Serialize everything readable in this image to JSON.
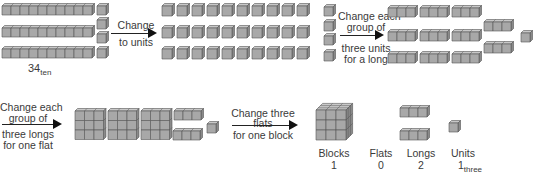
{
  "diagram": {
    "colors": {
      "face": "#a8a8a8",
      "top": "#c8c8c8",
      "side": "#8a8a8a",
      "edge": "#555555",
      "arrow": "#111111"
    },
    "steps": [
      {
        "id": "start",
        "label_main": "34",
        "label_sub": "ten",
        "contents": {
          "longs_of_ten": 3,
          "units": 4
        }
      },
      {
        "id": "step1",
        "arrow_line1": "Change",
        "arrow_line2": "to units",
        "contents": {
          "units": 34,
          "layout": "3 rows of 11 + 1"
        }
      },
      {
        "id": "step2",
        "arrow_line1": "Change each",
        "arrow_line2": "group of",
        "arrow_line3": "three units",
        "arrow_line4": "for a long",
        "contents": {
          "longs_of_three": 11,
          "units": 1
        }
      },
      {
        "id": "step3",
        "arrow_line1": "Change each",
        "arrow_line2": "group of",
        "arrow_line3": "three longs",
        "arrow_line4": "for one flat",
        "contents": {
          "flats": 3,
          "longs": 2,
          "units": 1
        }
      },
      {
        "id": "step4",
        "arrow_line1": "Change three",
        "arrow_line2": "flats",
        "arrow_line3": "for one block",
        "contents": {
          "blocks": 1,
          "flats": 0,
          "longs": 2,
          "units": 1
        }
      }
    ],
    "result": {
      "columns": [
        {
          "name": "Blocks",
          "value": "1"
        },
        {
          "name": "Flats",
          "value": "0"
        },
        {
          "name": "Longs",
          "value": "2"
        },
        {
          "name": "Units",
          "value": "1",
          "sub": "three"
        }
      ]
    }
  }
}
